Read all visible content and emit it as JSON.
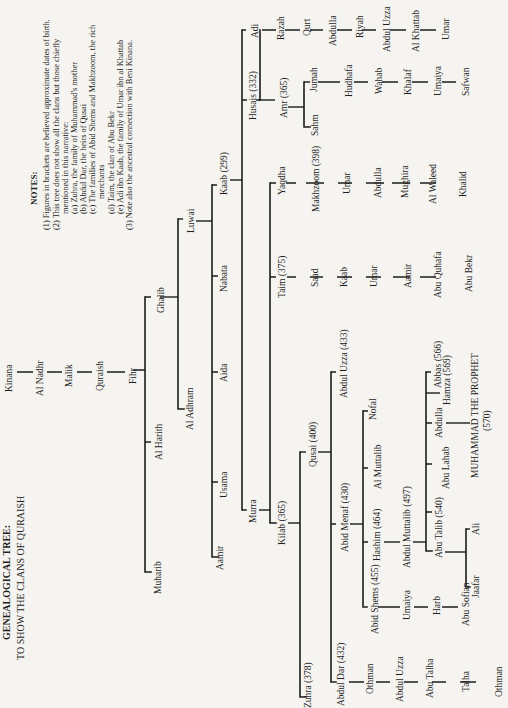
{
  "title": {
    "line1": "GENEALOGICAL TREE:",
    "line2": "TO SHOW THE CLANS OF QURAISH"
  },
  "notes": {
    "heading": "NOTES:",
    "items": [
      "(1) Figures in brackets are believed approximate dates of birth.",
      "(2) This tree does not show all the clans but those chiefly",
      "mentioned in this narrative:",
      "(a) Zuhra, the family of Muhammad's mother",
      "(b) Abdul Dar, the heirs of Qusai",
      "(c) The families of Abid Shems and Makhzoom, the rich",
      "merchants",
      "(d) Taim, the clan of Abu Bekr",
      "(e) Adi ibn Kaab, the family of Umar ibn al Khattab",
      "(3) Note also the ancestral connection with Beni Kinana."
    ]
  },
  "tree": {
    "kinana": "Kinana",
    "al_nadhr": "Al Nadhr",
    "malik": "Malik",
    "quraish": "Quraish",
    "fihr": "Fihr",
    "ghalib": "Ghalib",
    "al_harith": "Al Harith",
    "muharib": "Muharib",
    "luwai": "Luwai",
    "al_adhram": "Al Adhram",
    "kaab": "Kaab (299)",
    "nabata": "Nabata",
    "aida": "Aida",
    "usama": "Usama",
    "aamir_l": "Aamir",
    "husais": "Husais (332)",
    "adi": "Adi",
    "murra": "Murra",
    "amr": "Amr (365)",
    "jumah": "Jumah",
    "sahm": "Sahm",
    "hudhafa": "Hudhafa",
    "wahab": "Wahab",
    "khalaf": "Khalaf",
    "umaiya_j": "Umaiya",
    "safwan": "Safwan",
    "razah": "Razah",
    "qurt": "Qurt",
    "abdulla_adi": "Abdulla",
    "riyah": "Riyah",
    "abdul_uzza_adi": "Abdul Uzza",
    "al_khattab": "Al Khattab",
    "umar_adi": "Umar",
    "yaqdha": "Yaqdha",
    "taim": "Taim (375)",
    "kilab": "Kilab (365)",
    "makhzoom": "Makhzoom (398)",
    "umar_m": "Umar",
    "abdulla_m": "Abdulla",
    "mughira": "Mughira",
    "al_waleed": "Al Waleed",
    "khalid": "Khalid",
    "saad": "Saad",
    "kaab_t": "Kaab",
    "umar_t": "Umar",
    "aamir_t": "Aamir",
    "abu_quhafa": "Abu Quhafa",
    "abu_bekr": "Abu Bekr",
    "qusai": "Qusai (400)",
    "zuhra": "Zuhra (378)",
    "abdul_uzza_q": "Abdul Uzza (433)",
    "abid_menaf": "Abid Menaf (430)",
    "abdul_dar": "Abdul Dar (432)",
    "nofal": "Nofal",
    "al_muttalib": "Al Muttalib",
    "hashim": "Hashim (464)",
    "abid_shems": "Abid Shems (455)",
    "abdul_muttalib": "Abdul Muttalib (497)",
    "umaiya_s": "Umaiya",
    "harb": "Harb",
    "abu_sofian": "Abu Sofian",
    "abbas": "Abbas (566)",
    "hamza": "Hamza (569)",
    "abdulla_p": "Abdulla",
    "abu_lahab": "Abu Lahab",
    "abu_talib": "Abu Talib (540)",
    "muhammad": "MUHAMMAD THE PROPHET",
    "muhammad_date": "(570)",
    "ali": "Ali",
    "jaafar": "Jaafar",
    "othman_d": "Othman",
    "abdul_uzza_d": "Abdul Uzza",
    "abu_talha": "Abu Talha",
    "talha": "Talha",
    "othman_d2": "Othman"
  }
}
